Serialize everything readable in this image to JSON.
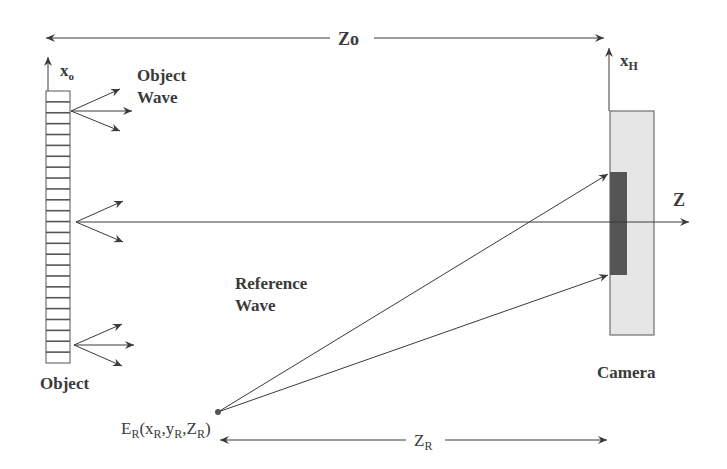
{
  "diagram": {
    "type": "digital-holography-setup",
    "labels": {
      "distance_object": "Zo",
      "object_axis": "x",
      "object_axis_sub": "o",
      "object_wave_line1": "Object",
      "object_wave_line2": "Wave",
      "object": "Object",
      "hologram_axis": "x",
      "hologram_axis_sub": "H",
      "optical_axis": "Z",
      "camera": "Camera",
      "reference_wave_line1": "Reference",
      "reference_wave_line2": "Wave",
      "ref_source_E": "E",
      "ref_source_E_sub": "R",
      "ref_source_open": "(x",
      "ref_source_x_sub": "R",
      "ref_source_comma1": ",y",
      "ref_source_y_sub": "R",
      "ref_source_comma2": ",Z",
      "ref_source_z_sub": "R",
      "ref_source_close": ")",
      "distance_reference": "Z",
      "distance_reference_sub": "R"
    },
    "colors": {
      "line": "#3a3a3a",
      "camera_body": "#e6e6e6",
      "sensor": "#555555",
      "object_stripe": "#555555"
    },
    "object_stripe_count": 25
  }
}
